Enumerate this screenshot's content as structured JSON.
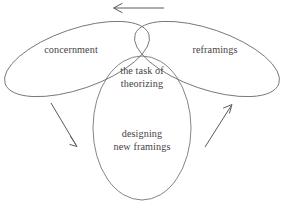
{
  "figure": {
    "type": "three-lobe-venn-diagram",
    "title": "the task of theorizing",
    "caption": "",
    "colors": {
      "background": "#ffffff",
      "stroke": "#6e6e6e",
      "arrow": "#5a5a5a",
      "text": "#46423f"
    },
    "lobes": [
      {
        "id": "left",
        "name": "concernment-lobe",
        "label": "concernment",
        "orientation": "tilted-up-right"
      },
      {
        "id": "right",
        "name": "reframings-lobe",
        "label": "reframings",
        "orientation": "tilted-up-left"
      },
      {
        "id": "bottom",
        "name": "designing-new-framings-lobe",
        "label": "designing\nnew framings",
        "label_line1": "designing",
        "label_line2": "new framings",
        "orientation": "vertical"
      }
    ],
    "center": {
      "name": "central-intersection",
      "label_line1": "the task of",
      "label_line2": "theorizing"
    },
    "arrows": [
      {
        "id": "top",
        "name": "arrow-top-leftward",
        "direction": "left",
        "from": "reframings",
        "to": "concernment"
      },
      {
        "id": "left",
        "name": "arrow-left-downward",
        "direction": "down-right",
        "from": "concernment",
        "to": "designing-new-framings"
      },
      {
        "id": "right",
        "name": "arrow-right-upward",
        "direction": "up-right",
        "from": "designing-new-framings",
        "to": "reframings"
      }
    ]
  }
}
